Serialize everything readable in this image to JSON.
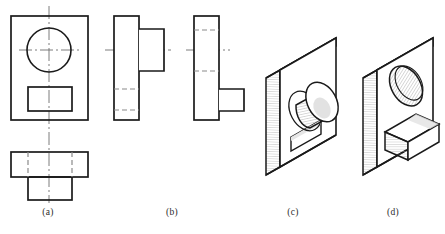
{
  "figure": {
    "kind": "engineering-drawing",
    "background_color": "#ffffff",
    "line_color": "#1a1a1a",
    "hidden_line_color": "#8a8a8a",
    "center_line_color": "#6e6e6e",
    "shade_color": "#d9d9d9"
  },
  "captions": {
    "a": "(a)",
    "b": "(b)",
    "c": "(c)",
    "d": "(d)"
  },
  "views": {
    "a": {
      "label": "(a)",
      "name": "front-and-top-view-set",
      "parts": [
        {
          "name": "front-view-outline",
          "shape": "rectangle",
          "x": 11,
          "y": 16,
          "w": 77,
          "h": 104
        },
        {
          "name": "front-view-circle",
          "shape": "circle",
          "cx": 49,
          "cy": 50,
          "r": 22
        },
        {
          "name": "front-view-slot-rectangle",
          "shape": "rectangle",
          "x": 28,
          "y": 87,
          "w": 44,
          "h": 24
        },
        {
          "name": "vertical-center-line",
          "shape": "center-line-v",
          "x": 49,
          "y1": 6,
          "y2": 202
        },
        {
          "name": "horizontal-center-line",
          "shape": "center-line-h",
          "y": 50,
          "x1": 20,
          "x2": 79
        },
        {
          "name": "top-view-wide-rectangle",
          "shape": "rectangle",
          "x": 11,
          "y": 152,
          "w": 77,
          "h": 25
        },
        {
          "name": "top-view-tab-rectangle",
          "shape": "rectangle",
          "x": 28,
          "y": 177,
          "w": 44,
          "h": 23
        },
        {
          "name": "top-view-hidden-line-left",
          "shape": "hidden-line-v",
          "x": 28,
          "y1": 152,
          "y2": 177
        },
        {
          "name": "top-view-hidden-line-right",
          "shape": "hidden-line-v",
          "x": 72,
          "y1": 152,
          "y2": 177
        }
      ]
    },
    "b": {
      "label": "(b)",
      "name": "two-side-view-variants",
      "parts": [
        {
          "name": "left-variant-body",
          "shape": "rectangle",
          "x": 114,
          "y": 16,
          "w": 25,
          "h": 104
        },
        {
          "name": "left-variant-boss",
          "shape": "rectangle",
          "x": 139,
          "y": 29,
          "w": 25,
          "h": 42
        },
        {
          "name": "left-variant-center-line",
          "shape": "center-line-h",
          "y": 50,
          "x1": 104,
          "x2": 172
        },
        {
          "name": "left-variant-hidden-upper",
          "shape": "hidden-line-h",
          "y": 89,
          "x1": 114,
          "x2": 139
        },
        {
          "name": "left-variant-hidden-lower",
          "shape": "hidden-line-h",
          "y": 110,
          "x1": 114,
          "x2": 139
        },
        {
          "name": "right-variant-body",
          "shape": "rectangle",
          "x": 194,
          "y": 16,
          "w": 25,
          "h": 104
        },
        {
          "name": "right-variant-boss",
          "shape": "rectangle",
          "x": 219,
          "y": 89,
          "w": 25,
          "h": 22
        },
        {
          "name": "right-variant-center-line",
          "shape": "center-line-h",
          "y": 50,
          "x1": 186,
          "x2": 230
        },
        {
          "name": "right-variant-hidden-upper",
          "shape": "hidden-line-h",
          "y": 30,
          "x1": 194,
          "x2": 219
        },
        {
          "name": "right-variant-hidden-lower",
          "shape": "hidden-line-h",
          "y": 71,
          "x1": 194,
          "x2": 219
        }
      ]
    },
    "c": {
      "label": "(c)",
      "name": "isometric-plate-with-cylinder-boss",
      "features": [
        "rectangular plate shown in isometric",
        "cylindrical boss protruding from front face",
        "rectangular through slot below the boss",
        "hatched / shaded cylinder surface"
      ]
    },
    "d": {
      "label": "(d)",
      "name": "isometric-plate-with-hole-and-block",
      "features": [
        "rectangular plate shown in isometric",
        "elliptical (circular) hole through front face",
        "rectangular block protruding below the hole",
        "hatched / shaded hole interior"
      ]
    }
  }
}
